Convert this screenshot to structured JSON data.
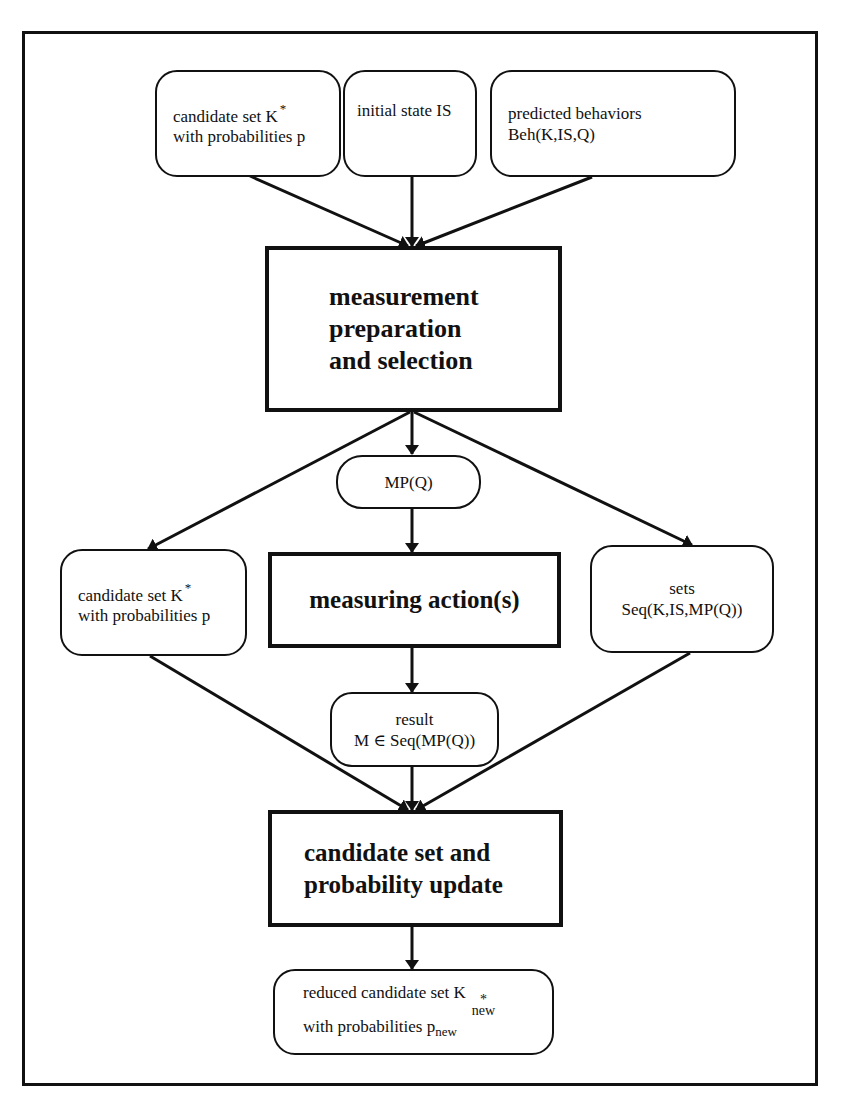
{
  "diagram": {
    "inputs": {
      "candidate_set": {
        "line1": "candidate set K",
        "sup": "*",
        "line2": "with probabilities p"
      },
      "initial_state": {
        "line1": "initial state IS"
      },
      "predicted_behaviors": {
        "line1": "predicted behaviors",
        "line2": "Beh(K,IS,Q)"
      }
    },
    "measurement_prep": {
      "line1": "measurement",
      "line2": "preparation",
      "line3": "and selection"
    },
    "mpq": {
      "label": "MP(Q)"
    },
    "candidate_set_mid": {
      "line1": "candidate set K",
      "sup": "*",
      "line2": "with probabilities p"
    },
    "measuring_action": {
      "label": "measuring action(s)"
    },
    "sets": {
      "line1": "sets",
      "line2": "Seq(K,IS,MP(Q))"
    },
    "result": {
      "line1": "result",
      "line2": "M ∈ Seq(MP(Q))"
    },
    "update": {
      "line1": "candidate set and",
      "line2": "probability update"
    },
    "output": {
      "line1": "reduced candidate set K",
      "sup": "*",
      "sub": "new",
      "line2": "with probabilities p",
      "line2_sub": "new"
    }
  }
}
